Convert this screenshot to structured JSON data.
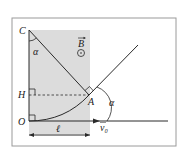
{
  "diagram": {
    "labels": {
      "C": "C",
      "H": "H",
      "O": "O",
      "A": "A",
      "alpha_top": "α",
      "alpha_right": "α",
      "B": "B",
      "length": "ℓ",
      "v0": "v₀"
    },
    "colors": {
      "shade": "#d9d9d9",
      "line": "#2a2a2a",
      "frame": "#9a9a9a"
    }
  }
}
